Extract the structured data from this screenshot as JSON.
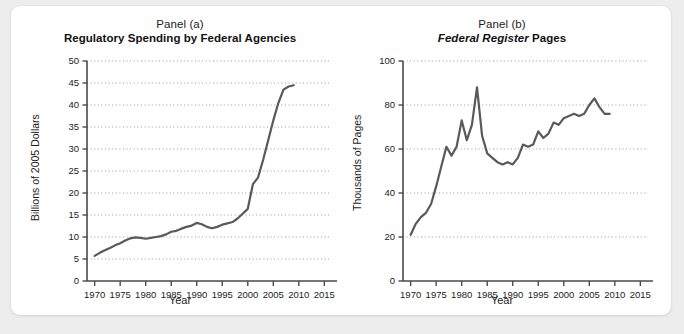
{
  "figure": {
    "background_color": "#ededed",
    "card_color": "#ffffff",
    "line_color": "#59595b",
    "axis_color": "#4a4a4a",
    "grid_color": "#9a9a9a"
  },
  "chart_data": [
    {
      "type": "line",
      "panel_label": "Panel (a)",
      "title": "Regulatory Spending by Federal Agencies",
      "title_italic_part": "",
      "xlabel": "Year",
      "ylabel": "Billions of 2005 Dollars",
      "xlim": [
        1968.5,
        2016.5
      ],
      "ylim": [
        0,
        50
      ],
      "xticks": [
        1970,
        1975,
        1980,
        1985,
        1990,
        1995,
        2000,
        2005,
        2010,
        2015
      ],
      "xtick_labels": [
        "1970",
        "1975",
        "1980",
        "1985",
        "1990",
        "1995",
        "2000",
        "2005",
        "2010",
        "2015"
      ],
      "yticks": [
        0,
        5,
        10,
        15,
        20,
        25,
        30,
        35,
        40,
        45,
        50
      ],
      "ytick_labels": [
        "0",
        "5",
        "10",
        "15",
        "20",
        "25",
        "30",
        "35",
        "40",
        "45",
        "50"
      ],
      "grid": "horizontal-dotted",
      "legend": "none",
      "series": [
        {
          "name": "Regulatory spending",
          "x": [
            1970,
            1971,
            1972,
            1973,
            1974,
            1975,
            1976,
            1977,
            1978,
            1979,
            1980,
            1981,
            1982,
            1983,
            1984,
            1985,
            1986,
            1987,
            1988,
            1989,
            1990,
            1991,
            1992,
            1993,
            1994,
            1995,
            1996,
            1997,
            1998,
            1999,
            2000,
            2001,
            2002,
            2003,
            2004,
            2005,
            2006,
            2007,
            2008,
            2009
          ],
          "values": [
            5.7,
            6.4,
            7.0,
            7.5,
            8.1,
            8.6,
            9.2,
            9.7,
            9.9,
            9.8,
            9.6,
            9.8,
            10.0,
            10.2,
            10.6,
            11.2,
            11.4,
            11.9,
            12.3,
            12.6,
            13.2,
            12.9,
            12.3,
            12.0,
            12.3,
            12.8,
            13.1,
            13.4,
            14.2,
            15.3,
            16.4,
            17.6,
            19.4,
            19.9,
            19.6,
            20.1,
            20.5,
            21.0,
            21.6,
            24.0
          ]
        }
      ],
      "series_continued_note": "steep rise after 2001 reaching about 44.5 by 2009"
    },
    {
      "type": "line",
      "panel_label": "Panel (b)",
      "title": "Federal Register Pages",
      "title_italic_part": "Federal Register",
      "title_upright_part": "Pages",
      "xlabel": "Year",
      "ylabel": "Thousands of Pages",
      "xlim": [
        1968.5,
        2016.5
      ],
      "ylim": [
        0,
        100
      ],
      "xticks": [
        1970,
        1975,
        1980,
        1985,
        1990,
        1995,
        2000,
        2005,
        2010,
        2015
      ],
      "xtick_labels": [
        "1970",
        "1975",
        "1980",
        "1985",
        "1990",
        "1995",
        "2000",
        "2005",
        "2010",
        "2015"
      ],
      "yticks": [
        0,
        20,
        40,
        60,
        80,
        100
      ],
      "ytick_labels": [
        "0",
        "20",
        "40",
        "60",
        "80",
        "100"
      ],
      "grid": "horizontal-dotted",
      "legend": "none",
      "series": [
        {
          "name": "Federal Register pages",
          "x": [
            1970,
            1971,
            1972,
            1973,
            1974,
            1975,
            1976,
            1977,
            1978,
            1979,
            1980,
            1981,
            1982,
            1983,
            1984,
            1985,
            1986,
            1987,
            1988,
            1989,
            1990,
            1991,
            1992,
            1993,
            1994,
            1995,
            1996,
            1997,
            1998,
            1999,
            2000,
            2001,
            2002,
            2003,
            2004,
            2005,
            2006,
            2007,
            2008,
            2009
          ],
          "values": [
            21,
            26,
            29,
            31,
            35,
            43,
            52,
            61,
            57,
            61,
            73,
            64,
            71,
            88,
            66,
            58,
            56,
            54,
            53,
            54,
            53,
            56,
            62,
            61,
            62,
            68,
            65,
            67,
            72,
            71,
            74,
            75,
            76,
            75,
            76,
            80,
            83,
            79,
            76,
            76
          ]
        }
      ]
    }
  ]
}
